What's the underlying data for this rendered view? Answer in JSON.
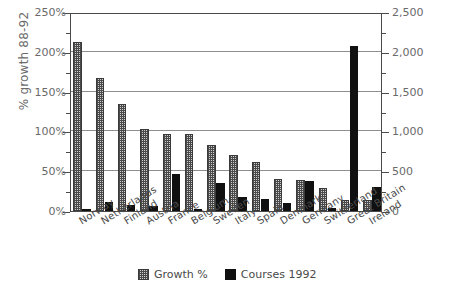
{
  "chart_data": {
    "type": "bar",
    "title": "",
    "subtitle": "",
    "categories": [
      "Norway",
      "Netherlands",
      "Finland",
      "Austria",
      "France",
      "Belgium",
      "Sweden",
      "Italy",
      "Spain",
      "Denmark",
      "Germany",
      "Switzerland",
      "Great Britain",
      "Ireland"
    ],
    "series": [
      {
        "name": "Growth %",
        "axis": "left",
        "pattern": "checkered",
        "color": "#cfcfcf",
        "values": [
          212,
          167,
          135,
          103,
          97,
          97,
          83,
          70,
          62,
          40,
          39,
          29,
          14,
          14
        ]
      },
      {
        "name": "Courses 1992",
        "axis": "right",
        "pattern": "solid",
        "color": "#101010",
        "values": [
          25,
          115,
          75,
          60,
          460,
          30,
          355,
          170,
          155,
          95,
          380,
          35,
          2075,
          300
        ]
      }
    ],
    "xlabel": "",
    "ylabel": "% growth 88-92",
    "ylabel_right": "Number of courses",
    "ylim": [
      0,
      250
    ],
    "ylim_right": [
      0,
      2500
    ],
    "yticks": [
      0,
      50,
      100,
      150,
      200,
      250
    ],
    "ytick_labels": [
      "0%",
      "50%",
      "100%",
      "150%",
      "200%",
      "250%"
    ],
    "yticks_right": [
      0,
      500,
      1000,
      1500,
      2000,
      2500
    ],
    "ytick_labels_right": [
      "0",
      "500",
      "1,000",
      "1,500",
      "2,000",
      "2,500"
    ],
    "minor_tick_step": 25,
    "minor_tick_step_right": 250,
    "grid": true,
    "grid_axis": "y",
    "legend": [
      "Growth %",
      "Courses 1992"
    ],
    "legend_position": "bottom-center"
  }
}
